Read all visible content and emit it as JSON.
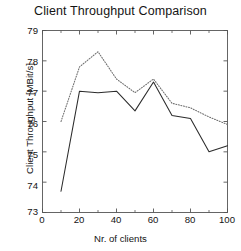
{
  "chart_data": {
    "type": "line",
    "title": "Client Throughput Comparison",
    "xlabel": "Nr. of clients",
    "ylabel": "Client Throughput [MBit/s]",
    "xlim": [
      0,
      100
    ],
    "ylim": [
      73,
      79
    ],
    "xticks": [
      0,
      20,
      40,
      60,
      80,
      100
    ],
    "xtick_labels": [
      "0",
      "20",
      "40",
      "60",
      "80",
      "100"
    ],
    "xminorticks": [
      10,
      30,
      50,
      70,
      90
    ],
    "yticks": [
      73,
      74,
      75,
      76,
      77,
      78,
      79
    ],
    "ytick_labels": [
      "73",
      "74",
      "75",
      "76",
      "77",
      "78",
      "79"
    ],
    "grid": false,
    "legend": "none",
    "x": [
      10,
      20,
      30,
      40,
      50,
      60,
      70,
      80,
      90,
      100
    ],
    "series": [
      {
        "name": "solid-series",
        "style": "solid",
        "color": "#2b2b2b",
        "values": [
          73.7,
          77.0,
          76.95,
          77.0,
          76.35,
          77.3,
          76.2,
          76.1,
          75.0,
          75.2
        ]
      },
      {
        "name": "dotted-series",
        "style": "dotted",
        "color": "#6e6e6e",
        "values": [
          76.0,
          77.8,
          78.3,
          77.4,
          76.95,
          77.4,
          76.6,
          76.45,
          76.15,
          75.9
        ]
      }
    ]
  },
  "axes": {
    "frame_color": "#555555",
    "background": "#ffffff"
  }
}
